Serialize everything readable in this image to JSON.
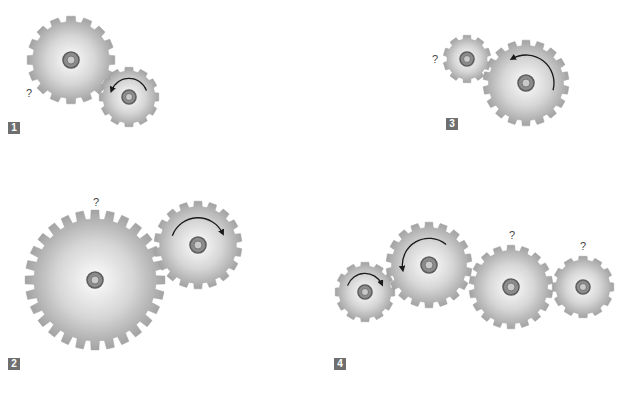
{
  "colors": {
    "gear_edge": "#9a9a9a",
    "gear_center": "#fdfdfd",
    "gear_mid": "#cfcfcf",
    "hub_outer": "#5e5e5e",
    "hub_ring": "#8c8c8c",
    "hub_inner": "#c9c9c9",
    "arrow": "#1a1a1a",
    "badge_bg": "#6f6f6f",
    "badge_text": "#ffffff",
    "question_text": "#444444"
  },
  "panels": [
    {
      "id": 1,
      "label": "1",
      "badge": {
        "x": 8,
        "y": 122
      },
      "gears": [
        {
          "cx": 71,
          "cy": 60,
          "r": 44,
          "teeth": 16,
          "hub_r": 8,
          "arrow": null
        },
        {
          "cx": 129,
          "cy": 97,
          "r": 30,
          "teeth": 12,
          "hub_r": 7,
          "arrow": "ccw-top"
        }
      ],
      "questions": [
        {
          "text": "?",
          "x": 29,
          "y": 93
        }
      ]
    },
    {
      "id": 2,
      "label": "2",
      "badge": {
        "x": 8,
        "y": 358
      },
      "gears": [
        {
          "cx": 95,
          "cy": 280,
          "r": 70,
          "teeth": 28,
          "hub_r": 8,
          "arrow": null
        },
        {
          "cx": 198,
          "cy": 245,
          "r": 44,
          "teeth": 18,
          "hub_r": 8,
          "arrow": "cw-top"
        }
      ],
      "questions": [
        {
          "text": "?",
          "x": 96,
          "y": 202
        }
      ]
    },
    {
      "id": 3,
      "label": "3",
      "badge": {
        "x": 446,
        "y": 118
      },
      "gears": [
        {
          "cx": 467,
          "cy": 59,
          "r": 24,
          "teeth": 10,
          "hub_r": 7,
          "arrow": null
        },
        {
          "cx": 526,
          "cy": 83,
          "r": 43,
          "teeth": 18,
          "hub_r": 8,
          "arrow": "ccw-right"
        }
      ],
      "questions": [
        {
          "text": "?",
          "x": 435,
          "y": 59
        }
      ]
    },
    {
      "id": 4,
      "label": "4",
      "badge": {
        "x": 334,
        "y": 358
      },
      "gears": [
        {
          "cx": 365,
          "cy": 292,
          "r": 30,
          "teeth": 12,
          "hub_r": 7,
          "arrow": "cw-top"
        },
        {
          "cx": 429,
          "cy": 265,
          "r": 43,
          "teeth": 18,
          "hub_r": 8,
          "arrow": "ccw-left"
        },
        {
          "cx": 511,
          "cy": 287,
          "r": 42,
          "teeth": 18,
          "hub_r": 8,
          "arrow": null
        },
        {
          "cx": 583,
          "cy": 287,
          "r": 31,
          "teeth": 12,
          "hub_r": 7,
          "arrow": null
        }
      ],
      "questions": [
        {
          "text": "?",
          "x": 512,
          "y": 235
        },
        {
          "text": "?",
          "x": 583,
          "y": 246
        }
      ]
    }
  ]
}
